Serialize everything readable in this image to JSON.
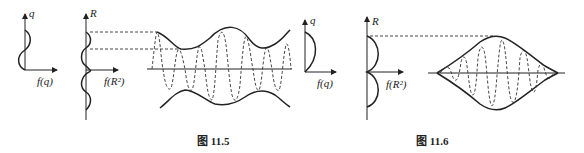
{
  "figures": [
    {
      "id": "fig-11-5",
      "caption": "图 11.5",
      "panels": {
        "left_plot": {
          "y_label": "q",
          "x_label": "f(q)"
        },
        "middle_plot": {
          "y_label": "R",
          "x_label": "f(R²)"
        },
        "right_plot": {
          "y_label": "q",
          "x_label": "f(q)"
        }
      }
    },
    {
      "id": "fig-11-6",
      "caption": "图 11.6",
      "panels": {
        "left_plot": {
          "y_label": "R",
          "x_label": "f(R²)"
        }
      }
    }
  ]
}
